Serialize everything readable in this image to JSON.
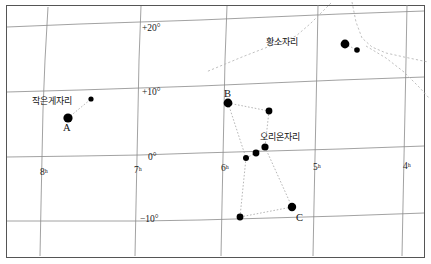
{
  "chart_data": {
    "type": "scatter",
    "title": "",
    "xlabel": "",
    "ylabel": "",
    "grid": true,
    "projection": "equatorial star chart",
    "xlim": [
      8.6,
      3.6
    ],
    "ylim": [
      -14,
      24
    ],
    "ra_ticks": [
      {
        "label": "8ʰ",
        "value": 8,
        "x": 40,
        "y": 167
      },
      {
        "label": "7ʰ",
        "value": 7,
        "x": 134,
        "y": 165
      },
      {
        "label": "6ʰ",
        "value": 6,
        "x": 221,
        "y": 163
      },
      {
        "label": "5ʰ",
        "value": 5,
        "x": 313,
        "y": 162
      },
      {
        "label": "4ʰ",
        "value": 4,
        "x": 403,
        "y": 161
      }
    ],
    "dec_ticks": [
      {
        "label": "+20°",
        "value": 20,
        "x": 142,
        "y": 23
      },
      {
        "label": "+10°",
        "value": 10,
        "x": 142,
        "y": 87
      },
      {
        "label": "0°",
        "value": 0,
        "x": 148,
        "y": 152
      },
      {
        "label": "−10°",
        "value": -10,
        "x": 140,
        "y": 214
      }
    ],
    "constellations": [
      {
        "name": "작은게자리",
        "label_x": 32,
        "label_y": 94,
        "stars": [
          {
            "id": "A",
            "x": 68,
            "y": 118,
            "size": 4.6,
            "label": "A",
            "label_x": 63,
            "label_y": 122
          },
          {
            "id": "cnc2",
            "x": 91,
            "y": 99,
            "size": 2.6,
            "label": "",
            "label_x": 0,
            "label_y": 0
          }
        ],
        "lines": [
          [
            "A",
            "cnc2"
          ]
        ]
      },
      {
        "name": "황소자리",
        "label_x": 266,
        "label_y": 35,
        "stars": [
          {
            "id": "tau1",
            "x": 345,
            "y": 44,
            "size": 4.4,
            "label": "",
            "label_x": 0,
            "label_y": 0
          },
          {
            "id": "tau2",
            "x": 357,
            "y": 50,
            "size": 2.8,
            "label": "",
            "label_x": 0,
            "label_y": 0
          }
        ],
        "lines": [
          [
            "tau1",
            "tau2"
          ]
        ]
      },
      {
        "name": "오리온자리",
        "label_x": 260,
        "label_y": 130,
        "stars": [
          {
            "id": "B",
            "x": 228,
            "y": 103,
            "size": 4.4,
            "label": "B",
            "label_x": 224,
            "label_y": 88
          },
          {
            "id": "bel",
            "x": 269,
            "y": 111,
            "size": 3.4,
            "label": "",
            "label_x": 0,
            "label_y": 0
          },
          {
            "id": "blt1",
            "x": 246,
            "y": 158,
            "size": 3.0,
            "label": "",
            "label_x": 0,
            "label_y": 0
          },
          {
            "id": "blt2",
            "x": 256,
            "y": 153,
            "size": 3.4,
            "label": "",
            "label_x": 0,
            "label_y": 0
          },
          {
            "id": "blt3",
            "x": 265,
            "y": 147,
            "size": 3.6,
            "label": "",
            "label_x": 0,
            "label_y": 0
          },
          {
            "id": "C",
            "x": 292,
            "y": 207,
            "size": 4.2,
            "label": "C",
            "label_x": 296,
            "label_y": 212
          },
          {
            "id": "sai",
            "x": 240,
            "y": 217,
            "size": 3.4,
            "label": "",
            "label_x": 0,
            "label_y": 0
          }
        ],
        "lines": [
          [
            "B",
            "bel"
          ],
          [
            "B",
            "blt1"
          ],
          [
            "bel",
            "blt3"
          ],
          [
            "blt1",
            "blt2"
          ],
          [
            "blt2",
            "blt3"
          ],
          [
            "blt1",
            "sai"
          ],
          [
            "blt3",
            "C"
          ],
          [
            "sai",
            "C"
          ]
        ]
      }
    ],
    "dotted_boundaries": [
      "M 331 3 L 310 24 L 296 36 L 242 57 L 206 72",
      "M 352 2 L 356 22 L 362 38 L 372 47 L 386 53 L 404 57 L 428 62",
      "M 366 46 L 386 58 L 404 72 L 420 88 L 429 98"
    ],
    "colors": {
      "grid": "#8a8a8a",
      "border": "#555555",
      "star": "#000000",
      "constellation_line": "#9a9a9a",
      "text": "#1a1a1a"
    }
  }
}
